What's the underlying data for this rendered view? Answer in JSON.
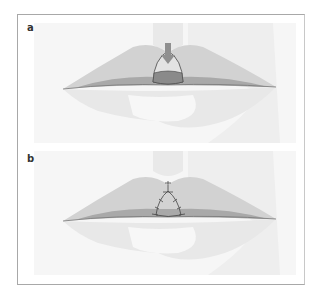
{
  "figure": {
    "panels": [
      {
        "label": "a",
        "description": "Lips with wedge excision marked at upper lip center, downward arrow"
      },
      {
        "label": "b",
        "description": "Lips after closure with sutures at upper lip center"
      }
    ]
  },
  "colors": {
    "background": "#ffffff",
    "face_shade": "#ececec",
    "upper_lip": "#cfcfcf",
    "upper_lip_dark": "#a9a9a9",
    "lower_lip": "#e6e6e6",
    "wedge_fill": "#8a8a8a",
    "wedge_light": "#d9d9d9",
    "outline": "#444444",
    "arrow": "#8f8f8f",
    "border": "#a8a8a8"
  }
}
